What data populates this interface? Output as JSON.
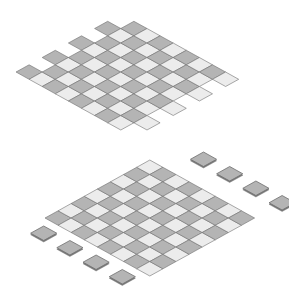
{
  "colors": {
    "dark": "#b4b4b4",
    "light": "#ececec",
    "stroke": "#6e6e6e",
    "background": "#ffffff"
  },
  "top_board": {
    "origin": [
      16,
      72
    ],
    "u": [
      13.1,
      -7.25
    ],
    "v": [
      13.1,
      7.25
    ],
    "rows": 9,
    "cols": 8,
    "missing": [
      [
        0,
        1
      ],
      [
        0,
        3
      ],
      [
        0,
        5
      ],
      [
        0,
        7
      ],
      [
        8,
        0
      ],
      [
        8,
        2
      ],
      [
        8,
        4
      ],
      [
        8,
        6
      ]
    ]
  },
  "bottom_board": {
    "origin": [
      45,
      218
    ],
    "u": [
      13.1,
      -7.25
    ],
    "v": [
      13.1,
      7.25
    ],
    "rows": 8,
    "cols": 8
  },
  "loose_tiles": [
    {
      "group": "upper-left",
      "cells": [
        [
          -1.6,
          0.5
        ],
        [
          -1.6,
          2.5
        ],
        [
          -1.6,
          4.5
        ],
        [
          -1.6,
          6.5
        ]
      ]
    },
    {
      "group": "lower-right",
      "cells": [
        [
          9.6,
          1.5
        ],
        [
          9.6,
          3.5
        ],
        [
          9.6,
          5.5
        ],
        [
          9.6,
          7.5
        ]
      ]
    }
  ]
}
